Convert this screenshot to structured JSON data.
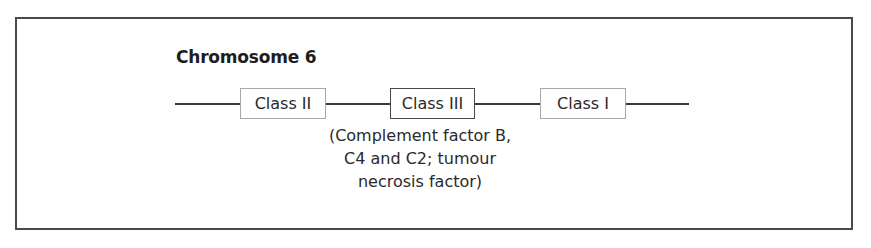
{
  "diagram": {
    "title": "Chromosome 6",
    "loci": [
      {
        "label": "Class II",
        "border": "light"
      },
      {
        "label": "Class III",
        "border": "dark"
      },
      {
        "label": "Class I",
        "border": "light"
      }
    ],
    "class_iii_note": {
      "lines": [
        "(Complement factor B,",
        "C4 and C2; tumour",
        "necrosis factor)"
      ]
    },
    "colors": {
      "frame": "#4a4a4a",
      "line": "#3a3a3a",
      "light_box_border": "#a8a8a8",
      "dark_box_border": "#4a4a4a",
      "text": "#2a2a2a"
    }
  }
}
